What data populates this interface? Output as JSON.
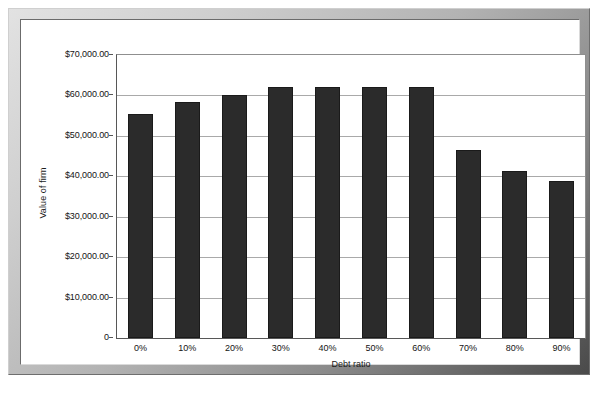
{
  "chart_data": {
    "type": "bar",
    "title": "",
    "xlabel": "Debt ratio",
    "ylabel": "Value of firm",
    "categories": [
      "0%",
      "10%",
      "20%",
      "30%",
      "40%",
      "50%",
      "60%",
      "70%",
      "80%",
      "90%"
    ],
    "values": [
      55500,
      58400,
      60000,
      62000,
      62000,
      62000,
      62000,
      46500,
      41300,
      38800
    ],
    "ylim": [
      0,
      70000
    ],
    "ytick_labels": [
      "$70,000.00",
      "$60,000.00",
      "$50,000.00",
      "$40,000.00",
      "$30,000.00",
      "$20,000.00",
      "$10,000.00",
      "0"
    ],
    "ytick_values": [
      70000,
      60000,
      50000,
      40000,
      30000,
      20000,
      10000,
      0
    ],
    "grid": true,
    "legend": "none",
    "bar_color": "#2b2b2b",
    "gridline_color": "#a9a9a9",
    "plot_background": "#ffffff"
  },
  "frame": {
    "border_color": "#b7b7b7",
    "card_background": "#ffffff"
  }
}
